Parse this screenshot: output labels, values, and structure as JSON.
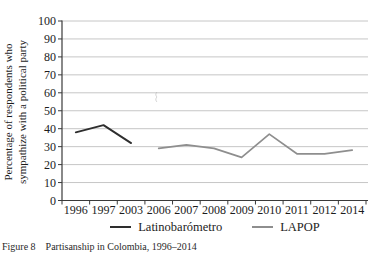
{
  "figure": {
    "caption": "Figure 8    Partisanship in Colombia, 1996–2014"
  },
  "chart_data": {
    "type": "line",
    "title": "",
    "xlabel": "",
    "ylabel": "Percentage of respondents who sympathize with a political party",
    "ylabel_lines": [
      "Percentage of respondents who",
      "sympathize with a political party"
    ],
    "categories": [
      "1996",
      "1997",
      "2003",
      "2006",
      "2007",
      "2008",
      "2009",
      "2010",
      "2011",
      "2012",
      "2014"
    ],
    "y_ticks": [
      0,
      10,
      20,
      30,
      40,
      50,
      60,
      70,
      80,
      90,
      100
    ],
    "ylim": [
      0,
      100
    ],
    "grid": "horizontal",
    "legend_position": "bottom",
    "series": [
      {
        "name": "Latinobarómetro",
        "color": "#2e2e2e",
        "values": [
          38,
          42,
          32,
          null,
          null,
          null,
          null,
          null,
          null,
          null,
          null
        ]
      },
      {
        "name": "LAPOP",
        "color": "#8e8e8e",
        "values": [
          null,
          null,
          null,
          29,
          31,
          29,
          24,
          37,
          26,
          26,
          28
        ]
      }
    ]
  },
  "colors": {
    "grid": "#c6c6c6",
    "axis": "#3a3a3a",
    "text": "#1c1c1c"
  }
}
